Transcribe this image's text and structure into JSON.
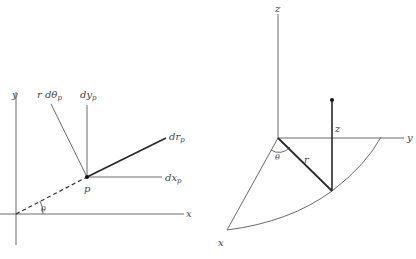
{
  "figures": [
    {
      "id": "polar-differentials",
      "labels": {
        "y_axis": "y",
        "x_axis": "x",
        "point": "p",
        "angle": "θ",
        "r_dtheta": {
          "main": "r dθ",
          "sub": "p"
        },
        "dy": {
          "main": "dy",
          "sub": "p"
        },
        "dr": {
          "main": "dr",
          "sub": "p"
        },
        "dx": {
          "main": "dx",
          "sub": "p"
        }
      }
    },
    {
      "id": "cylindrical-coordinates",
      "labels": {
        "z_axis": "z",
        "y_axis": "y",
        "x_axis": "x",
        "angle": "θ",
        "radius": "r",
        "height": "z"
      }
    }
  ],
  "colors": {
    "line": "#6a6a6a",
    "thick_line": "#2a2a2a",
    "text": "#444444",
    "background": "#ffffff"
  }
}
